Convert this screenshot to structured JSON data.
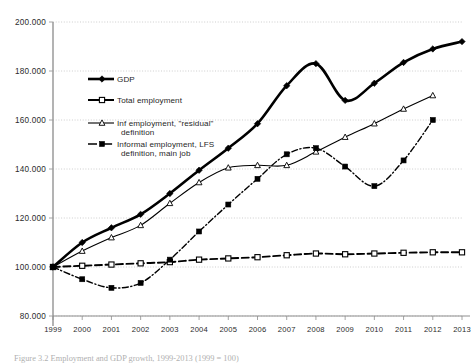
{
  "caption": "Figure 3.2 Employment and GDP growth, 1999-2013 (1999 = 100)",
  "colors": {
    "line": "#000000",
    "grid": "#b9b9b9",
    "axis": "#8d8d8d",
    "text": "#2b2b2b"
  },
  "axes": {
    "y_ticks": [
      "200.000",
      "180.000",
      "160.000",
      "140.000",
      "120.000",
      "100.000",
      "80.000"
    ],
    "x_ticks": [
      "1999",
      "2000",
      "2001",
      "2002",
      "2003",
      "2004",
      "2005",
      "2006",
      "2007",
      "2008",
      "2009",
      "2010",
      "2011",
      "2012",
      "2013"
    ]
  },
  "legend": {
    "items": [
      {
        "label": "GDP",
        "marker": "filled-diamond-marker",
        "style": "solid-thick"
      },
      {
        "label": "Total employment",
        "marker": "open-square-marker",
        "style": "dashed"
      },
      {
        "label": "Inf employment, \"residual\"",
        "label2": "definition",
        "marker": "open-triangle-marker",
        "style": "solid-thin"
      },
      {
        "label": "Informal employment, LFS",
        "label2": "definition, main job",
        "marker": "filled-square-marker",
        "style": "dash-dot"
      }
    ]
  },
  "chart_data": {
    "type": "line",
    "title": "",
    "xlabel": "",
    "ylabel": "",
    "ylim": [
      80,
      200
    ],
    "yticks": [
      80,
      100,
      120,
      140,
      160,
      180,
      200
    ],
    "grid": true,
    "legend_position": "inside-upper-left",
    "x": [
      1999,
      2000,
      2001,
      2002,
      2003,
      2004,
      2005,
      2006,
      2007,
      2008,
      2009,
      2010,
      2011,
      2012,
      2013
    ],
    "series": [
      {
        "name": "GDP",
        "values": [
          100,
          110,
          116,
          121.5,
          130,
          139.5,
          148.5,
          158.5,
          174,
          183,
          168,
          175,
          183.5,
          189,
          192
        ],
        "marker": "filled-diamond",
        "linestyle": "solid",
        "linewidth": 2.6
      },
      {
        "name": "Total employment",
        "values": [
          100,
          100.5,
          101,
          101.5,
          102,
          103,
          103.5,
          104,
          104.8,
          105.5,
          105.2,
          105.5,
          105.8,
          106,
          106
        ],
        "marker": "open-square",
        "linestyle": "dashed",
        "linewidth": 1.9
      },
      {
        "name": "Inf employment, \"residual\" definition",
        "values": [
          100,
          106.5,
          112,
          117,
          126,
          134.5,
          140.5,
          141.5,
          141.5,
          147,
          153,
          158.5,
          164.5,
          170,
          null
        ],
        "marker": "open-triangle",
        "linestyle": "solid",
        "linewidth": 1.1
      },
      {
        "name": "Informal employment, LFS definition, main job",
        "values": [
          100,
          95,
          91.5,
          93.5,
          103,
          114.5,
          125.5,
          136,
          146,
          148.5,
          141,
          133,
          143.5,
          160,
          null
        ],
        "marker": "filled-square",
        "linestyle": "dash-dot",
        "linewidth": 1.4
      }
    ]
  },
  "plot_geometry": {
    "left": 53,
    "right": 462,
    "top": 22,
    "bottom": 316
  }
}
